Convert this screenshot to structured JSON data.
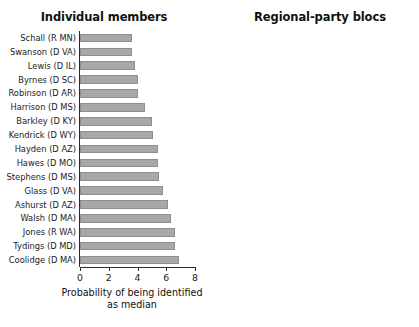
{
  "figure": {
    "background": "#ffffff",
    "bar_color": "#a8a8a8",
    "axis_color": "#2b2b2b"
  },
  "chart_data": [
    {
      "type": "bar",
      "orientation": "horizontal",
      "title": "Individual members",
      "xlabel": "Probability of being identified as median",
      "ylabel": "",
      "xlim": [
        0,
        8
      ],
      "xticks": [
        0,
        2,
        4,
        6,
        8
      ],
      "xtick_labels": [
        "0",
        "2",
        "4",
        "6",
        "8"
      ],
      "grid": false,
      "legend": "none",
      "categories": [
        "Schall (R MN)",
        "Swanson (D VA)",
        "Lewis (D IL)",
        "Byrnes (D SC)",
        "Robinson (D AR)",
        "Harrison (D MS)",
        "Barkley (D KY)",
        "Kendrick (D WY)",
        "Hayden (D AZ)",
        "Hawes (D MO)",
        "Stephens (D MS)",
        "Glass (D VA)",
        "Ashurst (D AZ)",
        "Walsh (D MA)",
        "Jones (R WA)",
        "Tydings (D MD)",
        "Coolidge (D MA)"
      ],
      "values": [
        3.6,
        3.6,
        3.8,
        4.0,
        4.0,
        4.5,
        5.0,
        5.1,
        5.4,
        5.4,
        5.5,
        5.8,
        6.1,
        6.3,
        6.6,
        6.6,
        6.9
      ]
    },
    {
      "type": "bar",
      "orientation": "horizontal",
      "title": "Regional-party blocs",
      "xlabel": "Probability of being identified as median",
      "ylabel": "",
      "xlim": [
        0,
        72
      ],
      "xticks": [
        0,
        10,
        20,
        30,
        40,
        50,
        60,
        70
      ],
      "xtick_labels": [
        "0",
        "10",
        "20",
        "30",
        "40",
        "50",
        "60",
        "70"
      ],
      "grid": false,
      "legend": "none",
      "categories": [
        "Northern\nDemocrats",
        "Republicans",
        "Border state\nDemocrats",
        "Confederate\nstate\nDemocrats"
      ],
      "category_lines": [
        [
          "Northern",
          "Democrats"
        ],
        [
          "Republicans"
        ],
        [
          "Border state",
          "Democrats"
        ],
        [
          "Confederate",
          "state",
          "Democrats"
        ]
      ],
      "values": [
        39,
        15,
        17,
        33
      ]
    }
  ]
}
